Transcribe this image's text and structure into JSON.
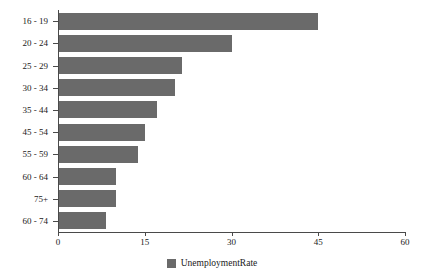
{
  "chart_data": {
    "type": "bar",
    "orientation": "horizontal",
    "title": "",
    "xlabel": "",
    "ylabel": "",
    "xlim": [
      0,
      60
    ],
    "xticks": [
      0,
      15,
      30,
      45,
      60
    ],
    "grid": false,
    "legend_position": "bottom-center",
    "categories": [
      "16 - 19",
      "20 - 24",
      "25 - 29",
      "30 - 34",
      "35 - 44",
      "45 - 54",
      "55 - 59",
      "60 - 64",
      "75+",
      "60 - 74"
    ],
    "series": [
      {
        "name": "UnemploymentRate",
        "color": "#6a6a6a",
        "values": [
          45,
          30,
          21.5,
          20.2,
          17.1,
          15,
          13.8,
          10,
          10,
          8.3
        ]
      }
    ]
  },
  "legend": {
    "entries": [
      {
        "label": "UnemploymentRate",
        "color": "#6a6a6a"
      }
    ]
  },
  "axis": {
    "x_tick_labels": [
      "0",
      "15",
      "30",
      "45",
      "60"
    ],
    "y_tick_labels": [
      "16 - 19",
      "20 - 24",
      "25 - 29",
      "30 - 34",
      "35 - 44",
      "45 - 54",
      "55 - 59",
      "60 - 64",
      "75+",
      "60 - 74"
    ]
  }
}
